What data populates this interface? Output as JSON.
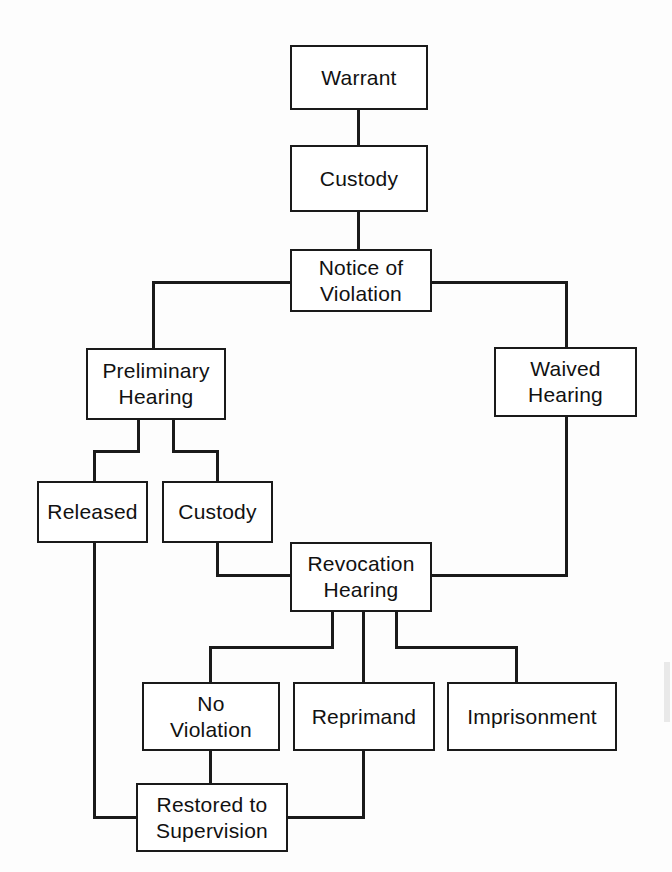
{
  "diagram": {
    "background_color": "#fdfdfd",
    "line_color": "#1a1a1a",
    "box_fill": "#ffffff",
    "nodes": [
      {
        "id": "warrant",
        "label": "Warrant",
        "x": 290,
        "y": 45,
        "w": 138,
        "h": 65
      },
      {
        "id": "custody_top",
        "label": "Custody",
        "x": 290,
        "y": 145,
        "w": 138,
        "h": 67
      },
      {
        "id": "notice",
        "label": "Notice of\nViolation",
        "x": 290,
        "y": 249,
        "w": 142,
        "h": 63
      },
      {
        "id": "prelim",
        "label": "Preliminary\nHearing",
        "x": 86,
        "y": 348,
        "w": 140,
        "h": 72
      },
      {
        "id": "waived",
        "label": "Waived\nHearing",
        "x": 494,
        "y": 347,
        "w": 143,
        "h": 70
      },
      {
        "id": "released",
        "label": "Released",
        "x": 37,
        "y": 481,
        "w": 111,
        "h": 62
      },
      {
        "id": "custody_mid",
        "label": "Custody",
        "x": 162,
        "y": 481,
        "w": 111,
        "h": 62
      },
      {
        "id": "revocation",
        "label": "Revocation\nHearing",
        "x": 290,
        "y": 542,
        "w": 142,
        "h": 70
      },
      {
        "id": "noviolation",
        "label": "No\nViolation",
        "x": 142,
        "y": 682,
        "w": 138,
        "h": 69
      },
      {
        "id": "reprimand",
        "label": "Reprimand",
        "x": 293,
        "y": 682,
        "w": 142,
        "h": 69
      },
      {
        "id": "imprisonment",
        "label": "Imprisonment",
        "x": 447,
        "y": 682,
        "w": 170,
        "h": 69
      },
      {
        "id": "restored",
        "label": "Restored to\nSupervision",
        "x": 136,
        "y": 783,
        "w": 152,
        "h": 69
      }
    ],
    "edges": [
      {
        "from": "warrant",
        "to": "custody_top",
        "type": "vertical"
      },
      {
        "from": "custody_top",
        "to": "notice",
        "type": "vertical"
      },
      {
        "from": "notice",
        "to": "prelim",
        "type": "left-elbow"
      },
      {
        "from": "notice",
        "to": "waived",
        "type": "right-elbow"
      },
      {
        "from": "prelim",
        "to": "released",
        "type": "split-left"
      },
      {
        "from": "prelim",
        "to": "custody_mid",
        "type": "split-right"
      },
      {
        "from": "custody_mid",
        "to": "revocation",
        "type": "elbow-right"
      },
      {
        "from": "waived",
        "to": "revocation",
        "type": "elbow-left"
      },
      {
        "from": "revocation",
        "to": "noviolation",
        "type": "fan-left"
      },
      {
        "from": "revocation",
        "to": "reprimand",
        "type": "vertical"
      },
      {
        "from": "revocation",
        "to": "imprisonment",
        "type": "fan-right"
      },
      {
        "from": "noviolation",
        "to": "restored",
        "type": "vertical"
      },
      {
        "from": "reprimand",
        "to": "restored",
        "type": "elbow-left"
      },
      {
        "from": "released",
        "to": "restored",
        "type": "long-left-elbow"
      }
    ]
  }
}
